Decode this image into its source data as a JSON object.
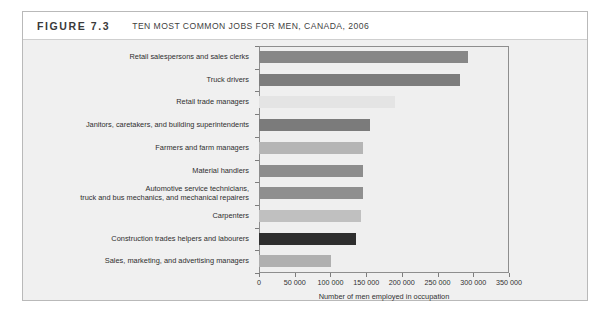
{
  "figure": {
    "number": "FIGURE 7.3",
    "title": "TEN MOST COMMON JOBS FOR MEN, CANADA, 2006"
  },
  "chart_data": {
    "type": "bar",
    "orientation": "horizontal",
    "title": "TEN MOST COMMON JOBS FOR MEN, CANADA, 2006",
    "xlabel": "Number of men employed in occupation",
    "ylabel": "",
    "xlim": [
      0,
      350000
    ],
    "xticks": [
      0,
      50000,
      100000,
      150000,
      200000,
      250000,
      300000,
      350000
    ],
    "xtick_labels": [
      "0",
      "50 000",
      "100 000",
      "150 000",
      "200 000",
      "250 000",
      "300 000",
      "350 000"
    ],
    "grid": false,
    "legend": "none",
    "categories": [
      "Retail salespersons and sales clerks",
      "Truck drivers",
      "Retail trade managers",
      "Janitors, caretakers, and building superintendents",
      "Farmers and farm managers",
      "Material handlers",
      "Automotive service technicians,\ntruck and bus mechanics, and mechanical repairers",
      "Carpenters",
      "Construction trades helpers and labourers",
      "Sales, marketing, and advertising managers"
    ],
    "values": [
      292000,
      281000,
      191000,
      155000,
      146000,
      146000,
      146000,
      143000,
      136000,
      101000
    ],
    "bar_colors": [
      "#878787",
      "#7d7d7d",
      "#e4e4e4",
      "#7b7b7b",
      "#b5b5b5",
      "#8d8d8d",
      "#8f8f8f",
      "#c0c0c0",
      "#2e2e2e",
      "#b0b0b0"
    ]
  }
}
